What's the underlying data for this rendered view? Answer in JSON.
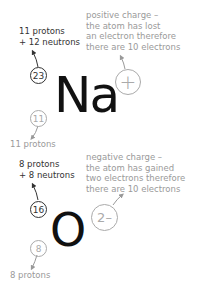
{
  "sodium": {
    "symbol": "Na",
    "mass_number": "23",
    "atomic_number": "11",
    "charge": "+",
    "mass_note_line1": "11 protons",
    "mass_note_line2": "+ 12 neutrons",
    "atomic_note": "11 protons",
    "charge_note": [
      "positive charge –",
      "the atom has lost",
      "an electron therefore",
      "there are 10 electrons"
    ]
  },
  "oxygen": {
    "symbol": "O",
    "mass_number": "16",
    "atomic_number": "8",
    "charge": "2–",
    "mass_note_line1": "8 protons",
    "mass_note_line2": "+ 8 neutrons",
    "atomic_note": "8 protons",
    "charge_note": [
      "negative charge –",
      "the atom has gained",
      "two electrons therefore",
      "there are 10 electrons"
    ]
  },
  "colors": {
    "dark": "#333333",
    "grey": "#9a9a9a",
    "symbol": "#111111"
  }
}
